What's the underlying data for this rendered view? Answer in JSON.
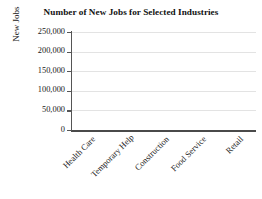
{
  "chart_data": {
    "type": "bar",
    "title": "Number of New Jobs for Selected Industries",
    "xlabel": "",
    "ylabel": "New Jobs",
    "categories": [
      "Health Care",
      "Temporary Help",
      "Construction",
      "Food Service",
      "Retail"
    ],
    "values": [
      null,
      null,
      null,
      null,
      null
    ],
    "series": [
      {
        "name": "New Jobs",
        "values": [
          null,
          null,
          null,
          null,
          null
        ]
      }
    ],
    "ylim": [
      0,
      250000
    ],
    "ytick_values": [
      0,
      50000,
      100000,
      150000,
      200000,
      250000
    ],
    "ytick_labels": [
      "0",
      "50,000",
      "100,000",
      "150,000",
      "200,000",
      "250,000"
    ],
    "grid": true,
    "grid_axis": "y",
    "legend": false,
    "legend_position": "none",
    "note": "Plot area is empty - axes and labels only, no bars drawn",
    "colors": {
      "background": "#ffffff",
      "axis": "#4a4a4a",
      "gridline": "#e3e3e3",
      "text": "#1a1a1a"
    }
  },
  "axes": {
    "y": {
      "title": "New Jobs",
      "ticks": [
        {
          "label": "250,000",
          "value": 250000
        },
        {
          "label": "200,000",
          "value": 200000
        },
        {
          "label": "150,000",
          "value": 150000
        },
        {
          "label": "100,000",
          "value": 100000
        },
        {
          "label": "50,000",
          "value": 50000
        },
        {
          "label": "0",
          "value": 0
        }
      ]
    },
    "x": {
      "title": "",
      "ticks": [
        {
          "label": "Health Care"
        },
        {
          "label": "Temporary Help"
        },
        {
          "label": "Construction"
        },
        {
          "label": "Food Service"
        },
        {
          "label": "Retail"
        }
      ]
    }
  }
}
